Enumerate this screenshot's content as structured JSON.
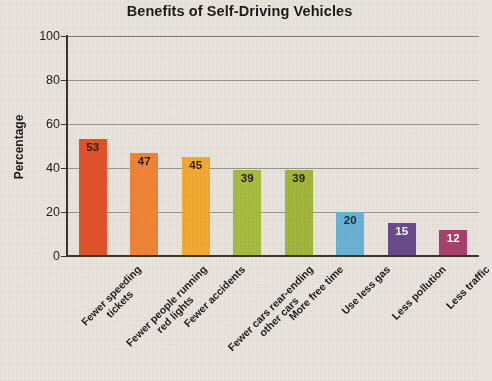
{
  "chart_data": {
    "type": "bar",
    "title": "Benefits of Self-Driving Vehicles",
    "xlabel": "",
    "ylabel": "Percentage",
    "ylim": [
      0,
      100
    ],
    "yticks": [
      0,
      20,
      40,
      60,
      80,
      100
    ],
    "grid": true,
    "legend": "none",
    "categories": [
      "Fewer speeding\ntickets",
      "Fewer people running\nred lights",
      "Fewer accidents",
      "Fewer cars rear-ending\nother cars",
      "More free time",
      "Use less gas",
      "Less pollution",
      "Less traffic"
    ],
    "values": [
      53,
      47,
      45,
      39,
      39,
      20,
      15,
      12
    ],
    "value_labels": [
      "53",
      "47",
      "45",
      "39",
      "39",
      "20",
      "15",
      "12"
    ],
    "bar_colors": [
      "#e2522a",
      "#ef8437",
      "#f1a92f",
      "#a7bc3f",
      "#a1b63c",
      "#68b2d8",
      "#6a4a8c",
      "#a8406e"
    ],
    "value_label_colors": [
      "#2a1a14",
      "#2a1a14",
      "#2a1a14",
      "#2a1a14",
      "#2a1a14",
      "#1d2a33",
      "#ffffff",
      "#ffffff"
    ]
  },
  "axis": {
    "tick_0": "0",
    "tick_20": "20",
    "tick_40": "40",
    "tick_60": "60",
    "tick_80": "80",
    "tick_100": "100"
  }
}
